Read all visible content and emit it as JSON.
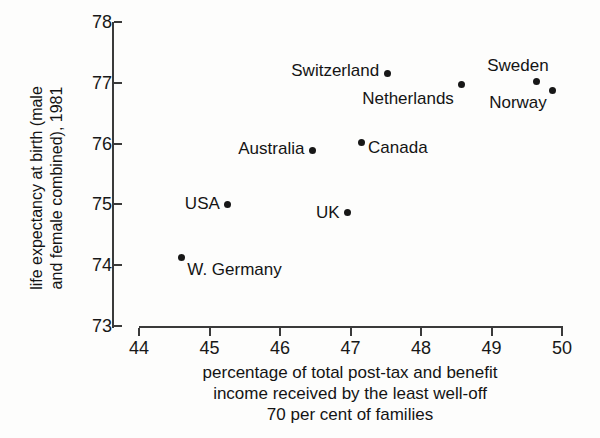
{
  "chart_data": {
    "type": "scatter",
    "title": "",
    "xlabel": "percentage of total post-tax and benefit income received by the least well-off 70 per cent of families",
    "xlabel_lines": [
      "percentage of total post-tax and benefit",
      "income received by the least well-off",
      "70 per cent of families"
    ],
    "ylabel": "life expectancy at birth (male and female combined), 1981",
    "ylabel_lines": [
      "life expectancy at birth (male",
      "and female combined), 1981"
    ],
    "xlim": [
      44,
      50
    ],
    "ylim": [
      73,
      78
    ],
    "xticks": [
      44,
      45,
      46,
      47,
      48,
      49,
      50
    ],
    "yticks": [
      73,
      74,
      75,
      76,
      77,
      78
    ],
    "grid": false,
    "legend": "none",
    "marker_color": "#171717",
    "axis_color": "#3a3a3a",
    "points": [
      {
        "name": "W. Germany",
        "x": 44.6,
        "y": 74.12,
        "label_side": "right",
        "label_dx": 6,
        "label_dy": 12
      },
      {
        "name": "USA",
        "x": 45.26,
        "y": 75.0,
        "label_side": "left",
        "label_dx": -8,
        "label_dy": 0
      },
      {
        "name": "Australia",
        "x": 46.46,
        "y": 75.88,
        "label_side": "left",
        "label_dx": -8,
        "label_dy": -2
      },
      {
        "name": "UK",
        "x": 46.96,
        "y": 74.86,
        "label_side": "left",
        "label_dx": -8,
        "label_dy": 0
      },
      {
        "name": "Canada",
        "x": 47.15,
        "y": 76.02,
        "label_side": "right",
        "label_dx": 7,
        "label_dy": 6
      },
      {
        "name": "Switzerland",
        "x": 47.52,
        "y": 77.15,
        "label_side": "left",
        "label_dx": -8,
        "label_dy": -3
      },
      {
        "name": "Netherlands",
        "x": 48.58,
        "y": 76.98,
        "label_side": "left",
        "label_dx": -8,
        "label_dy": 15
      },
      {
        "name": "Sweden",
        "x": 49.64,
        "y": 77.02,
        "label_side": "left",
        "label_dx": 12,
        "label_dy": -16
      },
      {
        "name": "Norway",
        "x": 49.87,
        "y": 76.87,
        "label_side": "left",
        "label_dx": -6,
        "label_dy": 12
      }
    ]
  }
}
